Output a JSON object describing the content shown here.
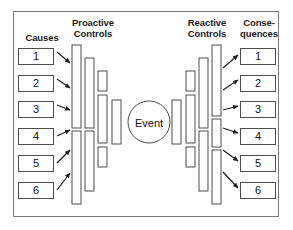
{
  "diagram": {
    "type": "bowtie-risk-diagram",
    "frame_border_color": "#7a7a7a",
    "line_color": "#4d4d4d",
    "background": "#ffffff",
    "headers": {
      "causes": "Causes",
      "proactive_line1": "Proactive",
      "proactive_line2": "Controls",
      "reactive_line1": "Reactive",
      "reactive_line2": "Controls",
      "consequences_line1": "Conse-",
      "consequences_line2": "quences"
    },
    "center": {
      "label": "Event",
      "shape": "circle",
      "cx": 149,
      "cy": 122,
      "r": 21
    },
    "causes": [
      {
        "label": "1",
        "y": 48
      },
      {
        "label": "2",
        "y": 75
      },
      {
        "label": "3",
        "y": 101
      },
      {
        "label": "4",
        "y": 128
      },
      {
        "label": "5",
        "y": 155
      },
      {
        "label": "6",
        "y": 182
      }
    ],
    "consequences": [
      {
        "label": "1",
        "y": 48
      },
      {
        "label": "2",
        "y": 75
      },
      {
        "label": "3",
        "y": 101
      },
      {
        "label": "4",
        "y": 128
      },
      {
        "label": "5",
        "y": 155
      },
      {
        "label": "6",
        "y": 182
      }
    ],
    "proactive_controls": [
      {
        "x": 72,
        "y": 45,
        "w": 9,
        "h": 83
      },
      {
        "x": 72,
        "y": 131,
        "w": 9,
        "h": 73
      },
      {
        "x": 85,
        "y": 58,
        "w": 9,
        "h": 70
      },
      {
        "x": 85,
        "y": 131,
        "w": 9,
        "h": 60
      },
      {
        "x": 98,
        "y": 71,
        "w": 9,
        "h": 20
      },
      {
        "x": 98,
        "y": 95,
        "w": 9,
        "h": 48
      },
      {
        "x": 98,
        "y": 147,
        "w": 9,
        "h": 20
      },
      {
        "x": 112,
        "y": 100,
        "w": 9,
        "h": 44
      }
    ],
    "reactive_controls": [
      {
        "x": 172,
        "y": 100,
        "w": 9,
        "h": 44
      },
      {
        "x": 186,
        "y": 71,
        "w": 9,
        "h": 20
      },
      {
        "x": 186,
        "y": 95,
        "w": 9,
        "h": 48
      },
      {
        "x": 186,
        "y": 147,
        "w": 9,
        "h": 20
      },
      {
        "x": 199,
        "y": 58,
        "w": 9,
        "h": 70
      },
      {
        "x": 199,
        "y": 131,
        "w": 9,
        "h": 60
      },
      {
        "x": 212,
        "y": 45,
        "w": 9,
        "h": 71
      },
      {
        "x": 212,
        "y": 119,
        "w": 9,
        "h": 28
      },
      {
        "x": 212,
        "y": 150,
        "w": 9,
        "h": 54
      }
    ],
    "left_arrows": [
      {
        "x1": 57,
        "y1": 52,
        "x2": 70,
        "y2": 63
      },
      {
        "x1": 57,
        "y1": 79,
        "x2": 70,
        "y2": 88
      },
      {
        "x1": 57,
        "y1": 105,
        "x2": 70,
        "y2": 110
      },
      {
        "x1": 57,
        "y1": 136,
        "x2": 70,
        "y2": 130
      },
      {
        "x1": 57,
        "y1": 163,
        "x2": 70,
        "y2": 150
      },
      {
        "x1": 57,
        "y1": 190,
        "x2": 70,
        "y2": 173
      }
    ],
    "right_arrows": [
      {
        "x1": 223,
        "y1": 68,
        "x2": 238,
        "y2": 55
      },
      {
        "x1": 223,
        "y1": 90,
        "x2": 238,
        "y2": 80
      },
      {
        "x1": 223,
        "y1": 110,
        "x2": 238,
        "y2": 106
      },
      {
        "x1": 223,
        "y1": 128,
        "x2": 238,
        "y2": 133
      },
      {
        "x1": 223,
        "y1": 150,
        "x2": 238,
        "y2": 161
      },
      {
        "x1": 223,
        "y1": 172,
        "x2": 238,
        "y2": 188
      }
    ]
  }
}
